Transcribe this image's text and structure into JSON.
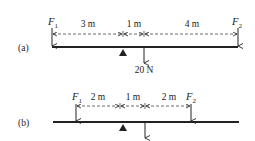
{
  "diagram": {
    "part_a": {
      "label": "(a)",
      "forces": {
        "f1": {
          "symbol": "F",
          "subscript": "1"
        },
        "f2": {
          "symbol": "F",
          "subscript": "2"
        },
        "load": "20 N"
      },
      "distances": [
        "3 m",
        "1 m",
        "4 m"
      ]
    },
    "part_b": {
      "label": "(b)",
      "forces": {
        "f1": {
          "symbol": "F",
          "subscript": "1"
        },
        "f2": {
          "symbol": "F",
          "subscript": "2"
        }
      },
      "distances": [
        "2 m",
        "1 m",
        "2 m"
      ]
    }
  }
}
